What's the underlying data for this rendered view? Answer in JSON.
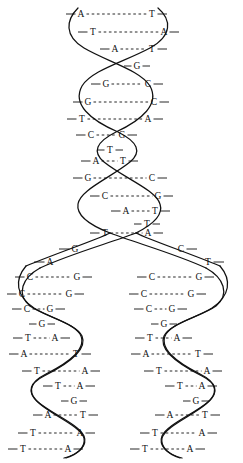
{
  "figure": {
    "stroke_color": "#111111",
    "background_color": "#ffffff",
    "width": 243,
    "height": 463
  },
  "parent_helix": {
    "name": "parent-double-helix",
    "rungs": [
      {
        "left": "A",
        "right": "T",
        "y": 14,
        "x1": 81,
        "x2": 152,
        "style": "dashed"
      },
      {
        "left": "T",
        "right": "A",
        "y": 32,
        "x1": 93,
        "x2": 164,
        "style": "dashed"
      },
      {
        "left": "A",
        "right": "T",
        "y": 49,
        "x1": 115,
        "x2": 152,
        "style": "dashed"
      },
      {
        "left": "G",
        "right": "",
        "y": 66,
        "x1": 137,
        "x2": 137,
        "style": "single"
      },
      {
        "left": "G",
        "right": "C",
        "y": 84,
        "x1": 106,
        "x2": 148,
        "style": "dashed"
      },
      {
        "left": "G",
        "right": "C",
        "y": 102,
        "x1": 88,
        "x2": 154,
        "style": "dashed"
      },
      {
        "left": "T",
        "right": "A",
        "y": 119,
        "x1": 82,
        "x2": 148,
        "style": "dashed"
      },
      {
        "left": "C",
        "right": "G",
        "y": 135,
        "x1": 91,
        "x2": 122,
        "style": "dashed"
      },
      {
        "left": "T",
        "right": "",
        "y": 150,
        "x1": 110,
        "x2": 110,
        "style": "single"
      },
      {
        "left": "A",
        "right": "T",
        "y": 161,
        "x1": 96,
        "x2": 123,
        "style": "dashed"
      },
      {
        "left": "G",
        "right": "C",
        "y": 178,
        "x1": 88,
        "x2": 152,
        "style": "dashed"
      },
      {
        "left": "C",
        "right": "G",
        "y": 196,
        "x1": 105,
        "x2": 158,
        "style": "dashed"
      },
      {
        "left": "A",
        "right": "T",
        "y": 211,
        "x1": 126,
        "x2": 155,
        "style": "dashed"
      },
      {
        "left": "T",
        "right": "",
        "y": 224,
        "x1": 147,
        "x2": 147,
        "style": "single"
      },
      {
        "left": "T",
        "right": "A",
        "y": 233,
        "x1": 105,
        "x2": 148,
        "style": "dashed"
      }
    ]
  },
  "fork": {
    "name": "replication-fork",
    "left_arm_labels": [
      {
        "base": "G",
        "x": 75,
        "y": 249
      },
      {
        "base": "A",
        "x": 50,
        "y": 262
      }
    ],
    "right_arm_labels": [
      {
        "base": "C",
        "x": 181,
        "y": 249
      },
      {
        "base": "T",
        "x": 208,
        "y": 262
      }
    ]
  },
  "daughter_left": {
    "name": "daughter-helix-left",
    "rungs": [
      {
        "left": "C",
        "right": "G",
        "y": 277,
        "x1": 30,
        "x2": 77,
        "style": "dashed"
      },
      {
        "left": "C",
        "right": "G",
        "y": 294,
        "x1": 22,
        "x2": 69,
        "style": "dashed"
      },
      {
        "left": "C",
        "right": "G",
        "y": 309,
        "x1": 27,
        "x2": 50,
        "style": "dashed"
      },
      {
        "left": "G",
        "right": "",
        "y": 324,
        "x1": 42,
        "x2": 42,
        "style": "single"
      },
      {
        "left": "T",
        "right": "A",
        "y": 338,
        "x1": 28,
        "x2": 55,
        "style": "dashed"
      },
      {
        "left": "A",
        "right": "T",
        "y": 354,
        "x1": 24,
        "x2": 76,
        "style": "dashed"
      },
      {
        "left": "T",
        "right": "A",
        "y": 371,
        "x1": 37,
        "x2": 85,
        "style": "dashed"
      },
      {
        "left": "T",
        "right": "A",
        "y": 386,
        "x1": 58,
        "x2": 80,
        "style": "dashed"
      },
      {
        "left": "G",
        "right": "",
        "y": 401,
        "x1": 74,
        "x2": 74,
        "style": "single"
      },
      {
        "left": "A",
        "right": "T",
        "y": 415,
        "x1": 48,
        "x2": 83,
        "style": "dashed"
      },
      {
        "left": "T",
        "right": "A",
        "y": 433,
        "x1": 33,
        "x2": 80,
        "style": "dashed"
      },
      {
        "left": "T",
        "right": "A",
        "y": 449,
        "x1": 23,
        "x2": 68,
        "style": "dashed"
      }
    ]
  },
  "daughter_right": {
    "name": "daughter-helix-right",
    "rungs": [
      {
        "left": "C",
        "right": "G",
        "y": 277,
        "x1": 152,
        "x2": 199,
        "style": "dashed"
      },
      {
        "left": "C",
        "right": "G",
        "y": 294,
        "x1": 144,
        "x2": 191,
        "style": "dashed"
      },
      {
        "left": "C",
        "right": "G",
        "y": 309,
        "x1": 149,
        "x2": 172,
        "style": "dashed"
      },
      {
        "left": "G",
        "right": "",
        "y": 324,
        "x1": 164,
        "x2": 164,
        "style": "single"
      },
      {
        "left": "T",
        "right": "A",
        "y": 338,
        "x1": 150,
        "x2": 177,
        "style": "dashed"
      },
      {
        "left": "A",
        "right": "T",
        "y": 354,
        "x1": 146,
        "x2": 198,
        "style": "dashed"
      },
      {
        "left": "T",
        "right": "A",
        "y": 371,
        "x1": 159,
        "x2": 207,
        "style": "dashed"
      },
      {
        "left": "T",
        "right": "A",
        "y": 386,
        "x1": 180,
        "x2": 202,
        "style": "dashed"
      },
      {
        "left": "G",
        "right": "",
        "y": 401,
        "x1": 196,
        "x2": 196,
        "style": "single"
      },
      {
        "left": "A",
        "right": "T",
        "y": 415,
        "x1": 170,
        "x2": 205,
        "style": "dashed"
      },
      {
        "left": "T",
        "right": "A",
        "y": 433,
        "x1": 155,
        "x2": 202,
        "style": "dashed"
      },
      {
        "left": "T",
        "right": "A",
        "y": 449,
        "x1": 145,
        "x2": 190,
        "style": "dashed"
      }
    ]
  },
  "backbones": {
    "parent_front": "M 78 8 C 66 20 64 36 84 48 C 108 62 140 70 150 86 C 160 104 142 120 116 132 C 96 142 92 152 104 162 C 124 178 156 190 160 204 C 164 216 150 226 136 233",
    "parent_back": "M 158 8 C 172 20 172 36 150 48 C 124 62 92 70 82 86 C 72 104 90 120 118 132 C 138 142 142 152 130 162 C 110 178 80 190 78 204 C 76 216 92 226 110 233",
    "fork_left_outer": "M 136 233 C 110 243 70 254 40 268",
    "fork_left_inner": "M 110 233 C 96 240 60 252 26 266",
    "fork_right_outer": "M 110 233 C 136 243 176 254 206 268",
    "fork_right_inner": "M 136 233 C 150 240 186 252 220 266",
    "left_front": "M 40 268 C 22 278 16 294 30 306 C 44 316 72 322 80 334 C 88 348 70 362 46 374 C 30 382 26 392 38 402 C 52 414 78 424 84 436 C 88 446 78 454 66 458",
    "left_back": "M 26 266 C 14 280 16 296 34 308 C 50 318 76 324 82 336 C 88 350 68 364 44 376 C 28 384 28 394 40 404 C 54 416 80 426 84 438 C 86 448 76 455 64 458",
    "right_front": "M 206 268 C 224 278 230 294 216 306 C 202 316 174 322 166 334 C 158 348 176 362 200 374 C 216 382 220 392 208 402 C 194 414 168 424 162 436 C 158 446 168 454 180 458",
    "right_back": "M 220 266 C 232 280 230 296 212 308 C 196 318 170 324 164 336 C 158 350 178 364 202 376 C 218 384 218 394 206 404 C 192 416 166 426 162 438 C 160 448 170 455 182 458"
  }
}
